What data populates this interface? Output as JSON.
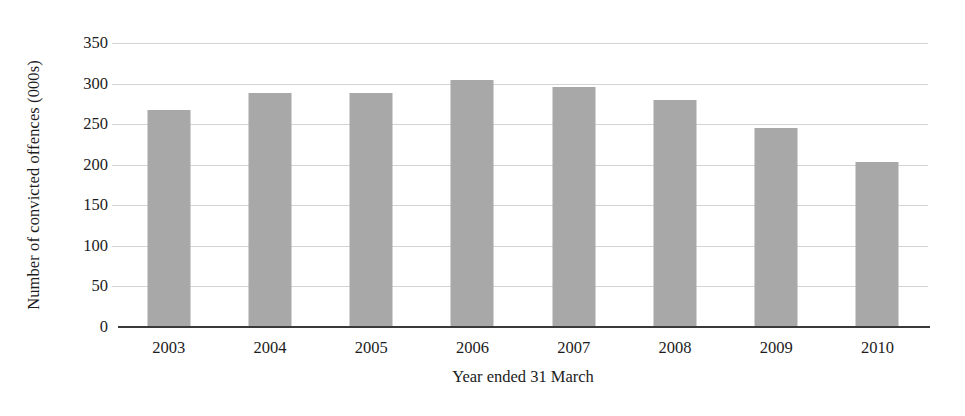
{
  "chart_data": {
    "type": "bar",
    "title": "",
    "subtitle": "",
    "xlabel": "Year ended 31 March",
    "ylabel": "Number of convicted offences (000s)",
    "categories": [
      "2003",
      "2004",
      "2005",
      "2006",
      "2007",
      "2008",
      "2009",
      "2010"
    ],
    "values": [
      268,
      288,
      288,
      304,
      296,
      280,
      245,
      203
    ],
    "series": [
      {
        "name": "Number of convicted offences (000s)",
        "values": [
          268,
          288,
          288,
          304,
          296,
          280,
          245,
          203
        ]
      }
    ],
    "ylim": [
      0,
      350
    ],
    "yticks": [
      0,
      50,
      100,
      150,
      200,
      250,
      300,
      350
    ],
    "ytick_labels": [
      "0",
      "50",
      "100",
      "150",
      "200",
      "250",
      "300",
      "350"
    ],
    "grid": true,
    "grid_axis": "y",
    "legend": false,
    "legend_position": "none",
    "annotations": [],
    "colors": {
      "bar_fill": "#a8a8a8",
      "gridline": "#d4d4d4",
      "axis_line": "#3a3a3a",
      "text": "#1c1c1c",
      "background": "#ffffff"
    }
  }
}
